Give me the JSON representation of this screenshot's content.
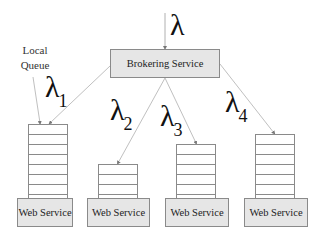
{
  "diagram": {
    "input_rate": {
      "symbol": "λ",
      "subscript": ""
    },
    "broker": {
      "label": "Brokering Service"
    },
    "local_queue_label": {
      "line1": "Local",
      "line2": "Queue"
    },
    "branches": [
      {
        "rate_symbol": "λ",
        "rate_subscript": "1",
        "queue_slots": 7,
        "service_label": "Web Service"
      },
      {
        "rate_symbol": "λ",
        "rate_subscript": "2",
        "queue_slots": 3,
        "service_label": "Web Service"
      },
      {
        "rate_symbol": "λ",
        "rate_subscript": "3",
        "queue_slots": 5,
        "service_label": "Web Service"
      },
      {
        "rate_symbol": "λ",
        "rate_subscript": "4",
        "queue_slots": 6,
        "service_label": "Web Service"
      }
    ],
    "colors": {
      "box_fill": "#e6e6e6",
      "box_border": "#8a8a8a",
      "line": "#b0b0b0"
    }
  }
}
